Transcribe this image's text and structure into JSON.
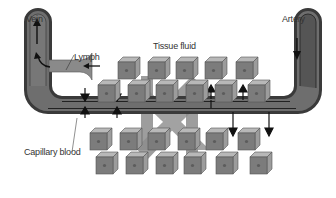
{
  "diagram": {
    "labels": {
      "vein": "Vein",
      "artery": "Artery",
      "lymph": "Lymph",
      "tissue_fluid": "Tissue fluid",
      "capillary_blood": "Capillary blood"
    },
    "colors": {
      "background": "#ffffff",
      "vessel_outer": "#3a3a3a",
      "vessel_fill": "#6e6e6e",
      "artery_fill": "#555555",
      "cube_front": "#7a7a7a",
      "cube_top": "#b5b5b5",
      "cube_side": "#9a9a9a",
      "nucleus": "#5a5a5a",
      "big_arrow": "#8c8c8c",
      "small_arrow": "#111111"
    },
    "flows": {
      "vein_direction": "up",
      "artery_direction": "down",
      "lymph_direction": "left-into-vein",
      "capillary_left_arrows": "into-capillary (both sides)",
      "capillary_right_up_arrows": "out-to-tissue-above",
      "capillary_right_down_arrows": "out-to-tissue-below",
      "big_arrow_left": "downward (tissue fluid to capillary)",
      "big_arrow_right": "upward (capillary to tissue fluid)"
    }
  }
}
